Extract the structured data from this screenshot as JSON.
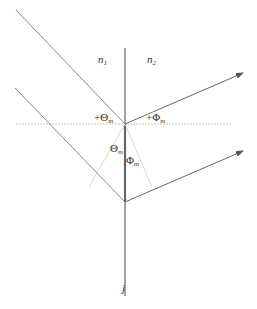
{
  "diagram": {
    "type": "refraction-geometry",
    "labels": {
      "n1": "n",
      "n1_sub": "1",
      "n2": "n",
      "n2_sub": "2",
      "theta_plus": "+Θ",
      "theta_plus_sub": "m",
      "phi_plus": "+Φ",
      "phi_plus_sub": "m",
      "theta": "Θ",
      "theta_sub": "m",
      "phi": "Φ",
      "phi_sub": "m",
      "interface": "j"
    },
    "colors": {
      "interface": "#444444",
      "rays": "#777777",
      "guides": "#bbbbbb"
    }
  }
}
